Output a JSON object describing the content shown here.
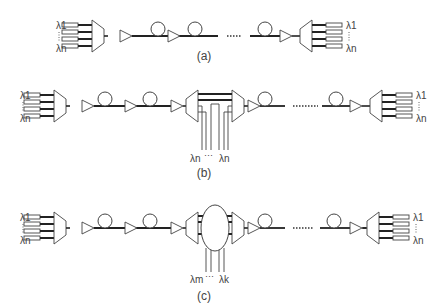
{
  "figure": {
    "panels": [
      {
        "id": "a",
        "caption": "(a)",
        "tx_labels": {
          "top": "λ1",
          "bottom": "λn"
        },
        "rx_labels": {
          "top": "λ1",
          "bottom": "λn"
        },
        "ellipsis": "......"
      },
      {
        "id": "b",
        "caption": "(b)",
        "tx_labels": {
          "top": "λ1",
          "bottom": "λn"
        },
        "rx_labels": {
          "top": "λ1",
          "bottom": "λn"
        },
        "oadm_labels": {
          "left": "λn",
          "dots": "···",
          "right": "λn"
        },
        "ellipsis": "......"
      },
      {
        "id": "c",
        "caption": "(c)",
        "tx_labels": {
          "top": "λ1",
          "bottom": "λn"
        },
        "rx_labels": {
          "top": "λ1",
          "bottom": "λn"
        },
        "oxc_labels": {
          "left": "λm",
          "dots": "···",
          "right": "λk"
        },
        "ellipsis": "......"
      }
    ],
    "components": [
      "transmitter-array",
      "multiplexer",
      "amplifier",
      "fiber-span",
      "add-drop-multiplexer",
      "optical-cross-connect",
      "demultiplexer",
      "receiver-array"
    ]
  }
}
